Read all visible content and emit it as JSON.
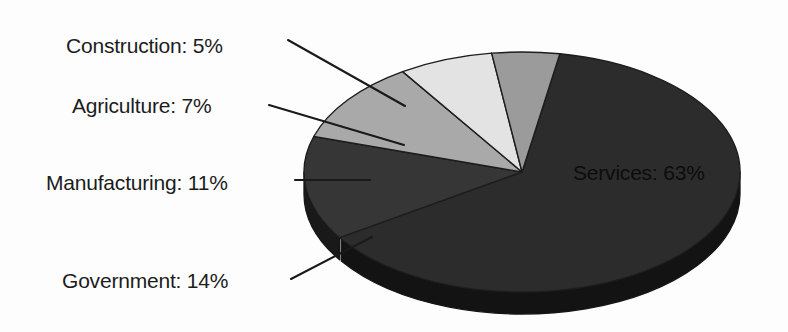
{
  "figure": {
    "background_color": "#fdfdfd",
    "label_color": "#1c1c1c",
    "inside_label_color": "#0d0d0d",
    "leader_line_color": "#1a1a1a",
    "slice_outline_color": "#1d1d1d"
  },
  "chart_data": {
    "type": "pie",
    "title": "",
    "subtitle": "",
    "xlabel": "",
    "ylabel": "",
    "legend_position": "none",
    "grid": false,
    "three_d": true,
    "units": "percent",
    "total": 100,
    "categories": [
      "Services",
      "Government",
      "Manufacturing",
      "Agriculture",
      "Construction"
    ],
    "values": [
      63,
      14,
      11,
      7,
      5
    ],
    "slices": [
      {
        "name": "Services",
        "value": 63,
        "label": "Services: 63%",
        "color": "#2c2c2c",
        "side_color": "#131313",
        "label_placement": "inside",
        "label_x": 573,
        "label_y": 180
      },
      {
        "name": "Government",
        "value": 14,
        "label": "Government: 14%",
        "color": "#363636",
        "side_color": "#191919",
        "label_placement": "outside-left",
        "label_x": 62,
        "label_y": 288
      },
      {
        "name": "Manufacturing",
        "value": 11,
        "label": "Manufacturing: 11%",
        "color": "#a9a9a9",
        "side_color": "#6a6a6a",
        "label_placement": "outside-left",
        "label_x": 46,
        "label_y": 190
      },
      {
        "name": "Agriculture",
        "value": 7,
        "label": "Agriculture: 7%",
        "color": "#e3e3e3",
        "side_color": "#9a9a9a",
        "label_placement": "outside-left",
        "label_x": 72,
        "label_y": 113
      },
      {
        "name": "Construction",
        "value": 5,
        "label": "Construction: 5%",
        "color": "#9b9b9b",
        "side_color": "#606060",
        "label_placement": "outside-left",
        "label_x": 66,
        "label_y": 53
      }
    ]
  }
}
